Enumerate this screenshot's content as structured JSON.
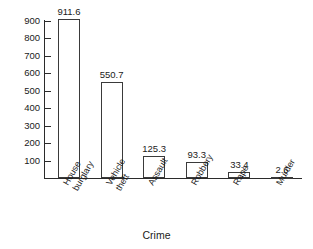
{
  "chart_data": {
    "type": "bar",
    "title": "",
    "subtitle": "",
    "xlabel": "Crime",
    "ylabel": "",
    "categories": [
      "House burglary",
      "Vehicle theft",
      "Assault",
      "Robbery",
      "Rape",
      "Murder"
    ],
    "category_lines": [
      [
        "House",
        "burglary"
      ],
      [
        "Vehicle",
        "theft"
      ],
      [
        "Assault"
      ],
      [
        "Robbery"
      ],
      [
        "Rape"
      ],
      [
        "Murder"
      ]
    ],
    "values": [
      911.6,
      550.7,
      125.3,
      93.3,
      33.4,
      2.6
    ],
    "value_labels": [
      "911.6",
      "550.7",
      "125.3",
      "93.3",
      "33.4",
      "2.6"
    ],
    "ylim": [
      0,
      950
    ],
    "yticks": [
      900,
      800,
      700,
      600,
      500,
      400,
      300,
      200,
      100
    ],
    "ytick_labels": [
      "900",
      "800",
      "700",
      "600",
      "500",
      "400",
      "300",
      "200",
      "100"
    ],
    "grid": false,
    "legend": false,
    "legend_position": "none",
    "colors": {
      "bar_fill": "#ffffff",
      "bar_stroke": "#3a3a3a",
      "axis": "#2b2b2b",
      "text": "#1a1a1a",
      "background": "#ffffff"
    }
  }
}
